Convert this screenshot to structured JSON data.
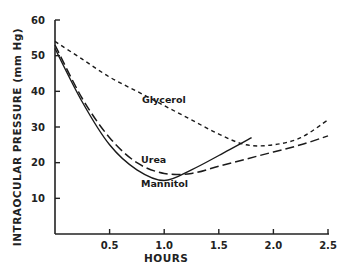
{
  "chart_data": {
    "type": "line",
    "title": "",
    "xlabel": "HOURS",
    "ylabel": "INTRAOCULAR PRESSURE (mm Hg)",
    "xlim": [
      0,
      2.5
    ],
    "ylim": [
      0,
      60
    ],
    "x_ticks": [
      0.5,
      1.0,
      1.5,
      2.0,
      2.5
    ],
    "x_tick_labels": [
      "0.5",
      "1.0",
      "1.5",
      "2.0",
      "2.5"
    ],
    "y_ticks": [
      10,
      20,
      30,
      40,
      50,
      60
    ],
    "y_tick_labels": [
      "10",
      "20",
      "30",
      "40",
      "50",
      "60"
    ],
    "grid": false,
    "legend": "inline labels next to curves",
    "series": [
      {
        "name": "Glycerol",
        "style": "short-dash",
        "x": [
          0,
          0.25,
          0.5,
          0.75,
          1.0,
          1.25,
          1.5,
          1.75,
          2.0,
          2.25,
          2.5
        ],
        "values": [
          54,
          49,
          44,
          40,
          36,
          32,
          28,
          25,
          25,
          27,
          32
        ]
      },
      {
        "name": "Urea",
        "style": "long-dash",
        "x": [
          0,
          0.25,
          0.5,
          0.75,
          1.0,
          1.25,
          1.5,
          1.75,
          2.0,
          2.25,
          2.5
        ],
        "values": [
          53,
          38,
          27,
          20,
          17,
          17,
          19,
          21,
          23,
          25,
          27.5
        ]
      },
      {
        "name": "Mannitol",
        "style": "solid",
        "x": [
          0,
          0.25,
          0.5,
          0.75,
          1.0,
          1.25,
          1.5,
          1.8
        ],
        "values": [
          52,
          37,
          25,
          18,
          15,
          18,
          22,
          27
        ]
      }
    ]
  }
}
